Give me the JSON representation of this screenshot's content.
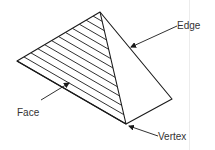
{
  "diagram": {
    "type": "pyramid-parts",
    "shape": "tetrahedron",
    "labels": {
      "edge": "Edge",
      "face": "Face",
      "vertex": "Vertex"
    },
    "colors": {
      "stroke": "#1a1a1a",
      "text": "#333333",
      "background": "#ffffff"
    },
    "vertices": {
      "apex": [
        100,
        12
      ],
      "left": [
        17,
        61
      ],
      "bottom": [
        126,
        124
      ],
      "right": [
        172,
        99
      ]
    },
    "hatch_line_count": 11
  }
}
